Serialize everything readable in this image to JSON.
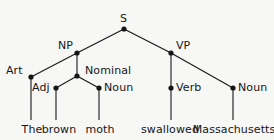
{
  "figure": {
    "name": "syntax-parse-tree",
    "background_color": "#f7f7f6",
    "ink_color": "#161616",
    "sentence": "The brown moth swallowed Massachusetts"
  },
  "nodes": [
    {
      "id": "s",
      "label": "S",
      "x": 124,
      "y": 29,
      "label_x": 120,
      "label_y": 13,
      "anchor": "left"
    },
    {
      "id": "np",
      "label": "NP",
      "x": 77,
      "y": 53,
      "label_x": 58,
      "label_y": 40,
      "anchor": "left"
    },
    {
      "id": "vp",
      "label": "VP",
      "x": 171,
      "y": 53,
      "label_x": 176,
      "label_y": 40,
      "anchor": "left"
    },
    {
      "id": "art",
      "label": "Art",
      "x": 31,
      "y": 77,
      "label_x": 6,
      "label_y": 65,
      "anchor": "left"
    },
    {
      "id": "nominal",
      "label": "Nominal",
      "x": 77,
      "y": 76,
      "label_x": 85,
      "label_y": 65,
      "anchor": "left"
    },
    {
      "id": "adj",
      "label": "Adj",
      "x": 56,
      "y": 88,
      "label_x": 32,
      "label_y": 82,
      "anchor": "left"
    },
    {
      "id": "noun1",
      "label": "Noun",
      "x": 99,
      "y": 88,
      "label_x": 104,
      "label_y": 82,
      "anchor": "left"
    },
    {
      "id": "verb",
      "label": "Verb",
      "x": 171,
      "y": 88,
      "label_x": 176,
      "label_y": 82,
      "anchor": "left"
    },
    {
      "id": "noun2",
      "label": "Noun",
      "x": 233,
      "y": 88,
      "label_x": 238,
      "label_y": 82,
      "anchor": "left"
    }
  ],
  "edges": [
    {
      "from": "s",
      "to": "np",
      "x1": 124,
      "y1": 29,
      "x2": 77,
      "y2": 53
    },
    {
      "from": "s",
      "to": "vp",
      "x1": 124,
      "y1": 29,
      "x2": 171,
      "y2": 53
    },
    {
      "from": "np",
      "to": "art",
      "x1": 77,
      "y1": 53,
      "x2": 31,
      "y2": 77
    },
    {
      "from": "np",
      "to": "nominal",
      "x1": 77,
      "y1": 53,
      "x2": 77,
      "y2": 76
    },
    {
      "from": "nominal",
      "to": "adj",
      "x1": 77,
      "y1": 76,
      "x2": 56,
      "y2": 88
    },
    {
      "from": "nominal",
      "to": "noun1",
      "x1": 77,
      "y1": 76,
      "x2": 99,
      "y2": 88
    },
    {
      "from": "vp",
      "to": "verb",
      "x1": 171,
      "y1": 53,
      "x2": 171,
      "y2": 88
    },
    {
      "from": "vp",
      "to": "noun2",
      "x1": 171,
      "y1": 53,
      "x2": 233,
      "y2": 88
    },
    {
      "from": "art",
      "to": "word-the",
      "x1": 31,
      "y1": 77,
      "x2": 31,
      "y2": 120
    },
    {
      "from": "adj",
      "to": "word-brown",
      "x1": 56,
      "y1": 88,
      "x2": 56,
      "y2": 120
    },
    {
      "from": "noun1",
      "to": "word-moth",
      "x1": 99,
      "y1": 88,
      "x2": 99,
      "y2": 120
    },
    {
      "from": "verb",
      "to": "word-swallowed",
      "x1": 171,
      "y1": 88,
      "x2": 171,
      "y2": 120
    },
    {
      "from": "noun2",
      "to": "word-massachusetts",
      "x1": 233,
      "y1": 88,
      "x2": 233,
      "y2": 120
    }
  ],
  "words": [
    {
      "id": "word-the",
      "label": "The",
      "x": 32,
      "y": 124
    },
    {
      "id": "word-brown",
      "label": "brown",
      "x": 59,
      "y": 124
    },
    {
      "id": "word-moth",
      "label": "moth",
      "x": 100,
      "y": 124
    },
    {
      "id": "word-swallowed",
      "label": "swallowed",
      "x": 170,
      "y": 124
    },
    {
      "id": "word-massachusetts",
      "label": "Massachusetts",
      "x": 234,
      "y": 124
    }
  ]
}
